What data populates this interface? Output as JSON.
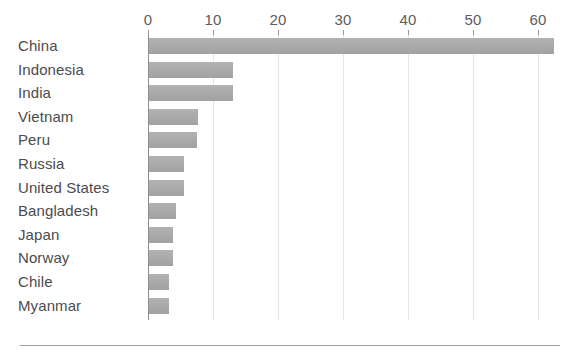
{
  "chart_data": {
    "type": "bar",
    "orientation": "horizontal",
    "title": "",
    "subtitle": "",
    "xlabel": "",
    "ylabel": "",
    "xlim": [
      0,
      63.4
    ],
    "ticks": [
      0,
      10,
      20,
      30,
      40,
      50,
      60
    ],
    "tick_labels": [
      "0",
      "10",
      "20",
      "30",
      "40",
      "50",
      "60"
    ],
    "grid": "vertical",
    "legend": "none",
    "bar_color": "#a9a9a9",
    "axis_color": "#8d8d8d",
    "grid_color": "#e4e4e4",
    "text_color": "#4c4c4c",
    "categories": [
      "China",
      "Indonesia",
      "India",
      "Vietnam",
      "Peru",
      "Russia",
      "United States",
      "Bangladesh",
      "Japan",
      "Norway",
      "Chile",
      "Myanmar"
    ],
    "values": [
      62.3,
      12.9,
      12.9,
      7.5,
      7.4,
      5.4,
      5.4,
      4.2,
      3.7,
      3.7,
      3.1,
      3.1
    ]
  }
}
